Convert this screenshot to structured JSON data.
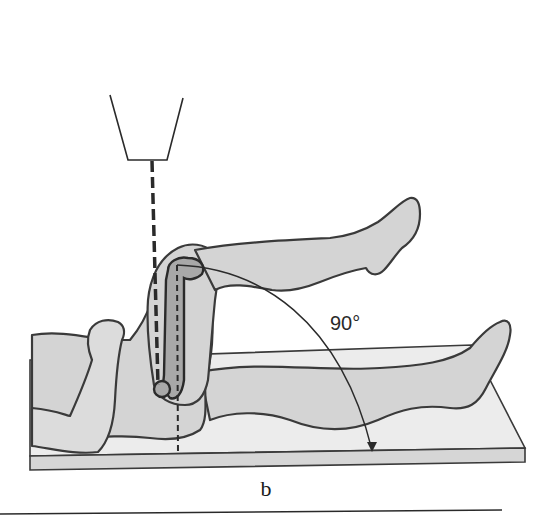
{
  "figure": {
    "angle_label": "90°",
    "panel_label": "b",
    "colors": {
      "skin": "#d4d4d4",
      "bone": "#a8a8a8",
      "outline": "#3a3a3a",
      "table": "#ececec",
      "background": "#ffffff"
    }
  }
}
